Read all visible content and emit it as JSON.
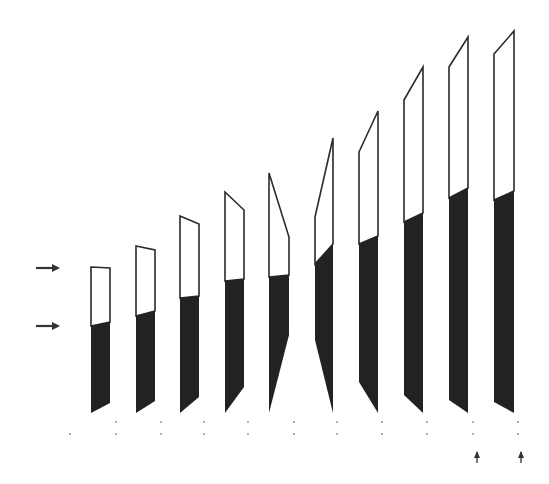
{
  "figure": {
    "width": 549,
    "height": 484,
    "background": "#ffffff",
    "fill_color": "#222222",
    "outline_color": "#2a2a2a",
    "arrow_color": "#333333"
  },
  "side_arrows": [
    {
      "x1": 36,
      "x2": 62,
      "y": 268
    },
    {
      "x1": 36,
      "x2": 62,
      "y": 326
    }
  ],
  "bars": [
    {
      "xl": 91,
      "xr": 110,
      "top_l": 267,
      "top_r": 268,
      "fill_l": 326,
      "fill_r": 322,
      "bot_l": 413,
      "bot_r": 403
    },
    {
      "xl": 136,
      "xr": 155,
      "top_l": 246,
      "top_r": 250,
      "fill_l": 316,
      "fill_r": 311,
      "bot_l": 413,
      "bot_r": 401
    },
    {
      "xl": 180,
      "xr": 199,
      "top_l": 216,
      "top_r": 224,
      "fill_l": 298,
      "fill_r": 296,
      "bot_l": 413,
      "bot_r": 397
    },
    {
      "xl": 225,
      "xr": 244,
      "top_l": 192,
      "top_r": 210,
      "fill_l": 281,
      "fill_r": 279,
      "bot_l": 413,
      "bot_r": 387
    },
    {
      "xl": 269,
      "xr": 289,
      "top_l": 173,
      "top_r": 237,
      "fill_l": 277,
      "fill_r": 275,
      "bot_l": 413,
      "bot_r": 335
    },
    {
      "xl": 315,
      "xr": 333,
      "top_l": 217,
      "top_r": 138,
      "fill_l": 264,
      "fill_r": 244,
      "bot_l": 340,
      "bot_r": 413
    },
    {
      "xl": 359,
      "xr": 378,
      "top_l": 152,
      "top_r": 111,
      "fill_l": 244,
      "fill_r": 236,
      "bot_l": 382,
      "bot_r": 413
    },
    {
      "xl": 404,
      "xr": 423,
      "top_l": 100,
      "top_r": 67,
      "fill_l": 222,
      "fill_r": 213,
      "bot_l": 395,
      "bot_r": 413
    },
    {
      "xl": 449,
      "xr": 468,
      "top_l": 67,
      "top_r": 37,
      "fill_l": 198,
      "fill_r": 188,
      "bot_l": 400,
      "bot_r": 413
    },
    {
      "xl": 494,
      "xr": 514,
      "top_l": 54,
      "top_r": 31,
      "fill_l": 200,
      "fill_r": 191,
      "bot_l": 402,
      "bot_r": 413
    }
  ],
  "tick_dots": [
    {
      "x": 70,
      "ys": [
        434
      ]
    },
    {
      "x": 116,
      "ys": [
        422,
        434
      ]
    },
    {
      "x": 161,
      "ys": [
        422,
        434
      ]
    },
    {
      "x": 204,
      "ys": [
        422,
        434
      ]
    },
    {
      "x": 248,
      "ys": [
        422,
        434
      ]
    },
    {
      "x": 294,
      "ys": [
        422,
        434
      ]
    },
    {
      "x": 337,
      "ys": [
        422,
        434
      ]
    },
    {
      "x": 382,
      "ys": [
        422,
        434
      ]
    },
    {
      "x": 427,
      "ys": [
        422,
        434
      ]
    },
    {
      "x": 473,
      "ys": [
        422,
        434
      ]
    },
    {
      "x": 518,
      "ys": [
        422,
        434
      ]
    }
  ],
  "bottom_arrows": [
    {
      "x": 477,
      "y_top": 449,
      "y_bot": 463
    },
    {
      "x": 521,
      "y_top": 449,
      "y_bot": 463
    }
  ]
}
